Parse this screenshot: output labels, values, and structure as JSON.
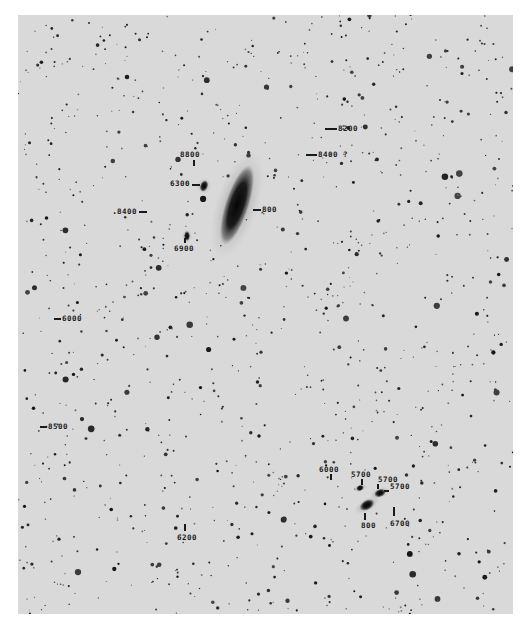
{
  "image": {
    "type": "astronomical-photographic-plate",
    "description": "Negative sky plate with galaxies labeled by recession velocity (km/s)"
  },
  "colors": {
    "background": "#ffffff",
    "plate": "#d9d9d9",
    "ink": "#1a1a1a"
  },
  "galaxies": [
    {
      "name": "main-spiral",
      "cx": 237,
      "cy": 205,
      "rx": 12,
      "ry": 42,
      "rot": 18
    },
    {
      "name": "companion-6300",
      "cx": 204,
      "cy": 186,
      "rx": 4,
      "ry": 6,
      "rot": 20
    },
    {
      "name": "companion-6900",
      "cx": 187,
      "cy": 236,
      "rx": 3,
      "ry": 5,
      "rot": 0
    },
    {
      "name": "group-800",
      "cx": 367,
      "cy": 505,
      "rx": 8,
      "ry": 5,
      "rot": -30
    },
    {
      "name": "group-5700",
      "cx": 380,
      "cy": 493,
      "rx": 6,
      "ry": 4,
      "rot": -20
    },
    {
      "name": "group-5700b",
      "cx": 360,
      "cy": 488,
      "rx": 4,
      "ry": 3,
      "rot": -20
    }
  ],
  "labels": [
    {
      "id": "v8200",
      "text": "8200",
      "x": 338,
      "y": 124,
      "tick": {
        "x": 325,
        "y": 128,
        "w": 12,
        "h": 1.5
      }
    },
    {
      "id": "v8400q",
      "text": "8400 ?",
      "x": 318,
      "y": 150,
      "tick": {
        "x": 306,
        "y": 154,
        "w": 11,
        "h": 1.5
      }
    },
    {
      "id": "v8800",
      "text": "8800",
      "x": 180,
      "y": 150,
      "tick": {
        "x": 193,
        "y": 160,
        "w": 1.5,
        "h": 6
      }
    },
    {
      "id": "v6300",
      "text": "6300",
      "x": 170,
      "y": 179,
      "tick": {
        "x": 192,
        "y": 184,
        "w": 8,
        "h": 1.5
      }
    },
    {
      "id": "v8400",
      "text": "8400",
      "x": 117,
      "y": 207,
      "tick": {
        "x": 139,
        "y": 211,
        "w": 8,
        "h": 1.5
      }
    },
    {
      "id": "v800",
      "text": "800",
      "x": 262,
      "y": 205,
      "tick": {
        "x": 253,
        "y": 209,
        "w": 8,
        "h": 1.5
      }
    },
    {
      "id": "v6900",
      "text": "6900",
      "x": 174,
      "y": 244,
      "tick": {
        "x": 184,
        "y": 238,
        "w": 1.5,
        "h": 5
      }
    },
    {
      "id": "v6000a",
      "text": "6000",
      "x": 62,
      "y": 314,
      "tick": {
        "x": 54,
        "y": 318,
        "w": 7,
        "h": 1.5
      }
    },
    {
      "id": "v8500",
      "text": "8500",
      "x": 48,
      "y": 422,
      "tick": {
        "x": 40,
        "y": 426,
        "w": 7,
        "h": 1.5
      }
    },
    {
      "id": "v6000b",
      "text": "6000",
      "x": 319,
      "y": 465,
      "tick": {
        "x": 330,
        "y": 474,
        "w": 1.5,
        "h": 6
      }
    },
    {
      "id": "v5700a",
      "text": "5700",
      "x": 351,
      "y": 470,
      "tick": {
        "x": 361,
        "y": 479,
        "w": 1.5,
        "h": 6
      }
    },
    {
      "id": "v5700b",
      "text": "5700",
      "x": 378,
      "y": 475,
      "tick": {
        "x": 377,
        "y": 484,
        "w": 1.5,
        "h": 5
      }
    },
    {
      "id": "v5700c",
      "text": "5700",
      "x": 390,
      "y": 482,
      "tick": {
        "x": 384,
        "y": 490,
        "w": 5,
        "h": 1.5
      }
    },
    {
      "id": "v800b",
      "text": "800",
      "x": 361,
      "y": 521,
      "tick": {
        "x": 364,
        "y": 513,
        "w": 1.5,
        "h": 7
      }
    },
    {
      "id": "v6700",
      "text": "6700",
      "x": 390,
      "y": 519,
      "tick": {
        "x": 393,
        "y": 507,
        "w": 1.5,
        "h": 9
      }
    },
    {
      "id": "v6200",
      "text": "6200",
      "x": 177,
      "y": 533,
      "tick": {
        "x": 184,
        "y": 524,
        "w": 1.5,
        "h": 7
      }
    }
  ],
  "star_field": {
    "count": 1100,
    "seed": 42
  }
}
